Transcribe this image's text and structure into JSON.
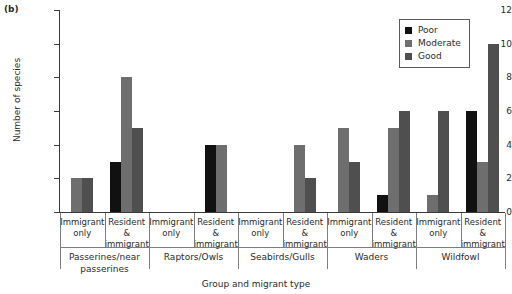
{
  "panel_label": "(b)",
  "chart_data": {
    "type": "bar",
    "title": "",
    "panel": "(b)",
    "xlabel": "Group and migrant type",
    "ylabel": "Number of species",
    "ylim": [
      0,
      12
    ],
    "yticks": [
      0,
      2,
      4,
      6,
      8,
      10,
      12
    ],
    "grid": false,
    "legend_position": "top-right",
    "legend": [
      "Poor",
      "Moderate",
      "Good"
    ],
    "colors": {
      "Poor": "#111111",
      "Moderate": "#6e6e6e",
      "Good": "#4f4f4f"
    },
    "groups": [
      "Passerines/near passerines",
      "Raptors/Owls",
      "Seabirds/Gulls",
      "Waders",
      "Wildfowl"
    ],
    "categories": [
      "Immigrant only",
      "Resident & immigrant",
      "Immigrant only",
      "Resident & immigrant",
      "Immigrant only",
      "Resident & immigrant",
      "Immigrant only",
      "Resident & immigrant",
      "Immigrant only",
      "Resident & immigrant"
    ],
    "series": [
      {
        "name": "Poor",
        "values": [
          0,
          3,
          0,
          4,
          0,
          0,
          0,
          1,
          0,
          6
        ]
      },
      {
        "name": "Moderate",
        "values": [
          2,
          8,
          0,
          4,
          0,
          4,
          5,
          5,
          1,
          3
        ]
      },
      {
        "name": "Good",
        "values": [
          2,
          5,
          0,
          0,
          0,
          2,
          3,
          6,
          6,
          10
        ]
      }
    ]
  },
  "axis": {
    "y_title": "Number of species",
    "x_title": "Group and migrant type",
    "y_tick_labels": [
      "12",
      "10",
      "8",
      "6",
      "4",
      "2",
      "0"
    ]
  },
  "group_labels": [
    "Passerines/near\npasserines",
    "Raptors/Owls",
    "Seabirds/Gulls",
    "Waders",
    "Wildfowl"
  ],
  "category_labels": [
    "Immigrant\nonly",
    "Resident &\nimmigrant",
    "Immigrant\nonly",
    "Resident &\nimmigrant",
    "Immigrant\nonly",
    "Resident &\nimmigrant",
    "Immigrant\nonly",
    "Resident &\nimmigrant",
    "Immigrant\nonly",
    "Resident &\nimmigrant"
  ]
}
